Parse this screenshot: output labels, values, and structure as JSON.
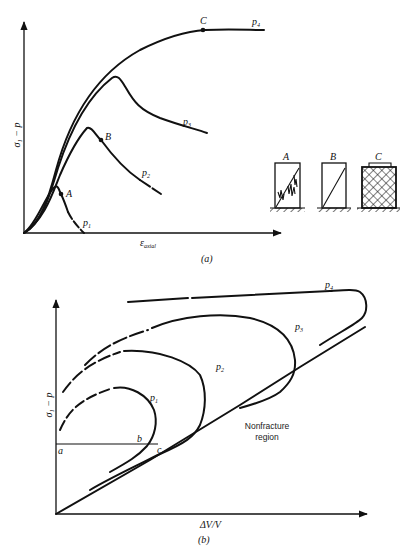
{
  "figure_a": {
    "caption": "(a)",
    "y_axis_label": "σ₁ − p",
    "x_axis_label_main": "ε",
    "x_axis_label_sub": "axial",
    "curves": [
      {
        "name": "p1",
        "label": "p",
        "sub": "1"
      },
      {
        "name": "p2",
        "label": "p",
        "sub": "2"
      },
      {
        "name": "p3",
        "label": "p",
        "sub": "3"
      },
      {
        "name": "p4",
        "label": "p",
        "sub": "4"
      }
    ],
    "points": [
      {
        "name": "A",
        "label": "A"
      },
      {
        "name": "B",
        "label": "B"
      },
      {
        "name": "C",
        "label": "C"
      }
    ],
    "specimens": [
      {
        "name": "A",
        "label": "A",
        "failure": "axial splitting with shear"
      },
      {
        "name": "B",
        "label": "B",
        "failure": "single shear plane"
      },
      {
        "name": "C",
        "label": "C",
        "failure": "ductile / distributed"
      }
    ]
  },
  "figure_b": {
    "caption": "(b)",
    "y_axis_label": "σ₁ − p",
    "x_axis_label": "ΔV/V",
    "region_label_line1": "Nonfracture",
    "region_label_line2": "region",
    "curves": [
      {
        "name": "p1",
        "label": "p",
        "sub": "1"
      },
      {
        "name": "p2",
        "label": "p",
        "sub": "2"
      },
      {
        "name": "p3",
        "label": "p",
        "sub": "3"
      },
      {
        "name": "p4",
        "label": "p",
        "sub": "4"
      }
    ],
    "points": [
      {
        "name": "a",
        "label": "a"
      },
      {
        "name": "b",
        "label": "b"
      },
      {
        "name": "c",
        "label": "c"
      }
    ]
  }
}
